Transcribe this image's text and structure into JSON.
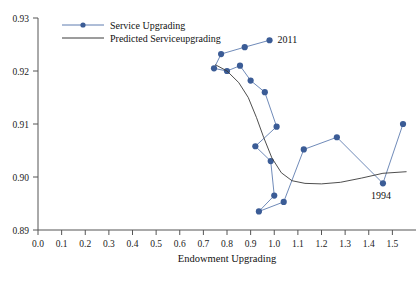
{
  "chart_data": {
    "type": "line",
    "title": "",
    "xlabel": "Endowment Upgrading",
    "ylabel": "",
    "xlim": [
      0.0,
      1.6
    ],
    "ylim": [
      0.89,
      0.93
    ],
    "grid": false,
    "legend_position": "top-left",
    "x_ticks": [
      "0.0",
      "0.1",
      "0.2",
      "0.3",
      "0.4",
      "0.5",
      "0.6",
      "0.7",
      "0.8",
      "0.9",
      "1.0",
      "1.1",
      "1.2",
      "1.3",
      "1.4",
      "1.5"
    ],
    "x_tick_values": [
      0.0,
      0.1,
      0.2,
      0.3,
      0.4,
      0.5,
      0.6,
      0.7,
      0.8,
      0.9,
      1.0,
      1.1,
      1.2,
      1.3,
      1.4,
      1.5
    ],
    "y_ticks": [
      "0.89",
      "0.90",
      "0.91",
      "0.92",
      "0.93"
    ],
    "y_tick_values": [
      0.89,
      0.9,
      0.91,
      0.92,
      0.93
    ],
    "series": [
      {
        "name": "Service Upgrading",
        "marker": "circle",
        "color": "#3b5c96",
        "line_color": "#5f7db0",
        "points": [
          {
            "x": 1.545,
            "y": 0.91
          },
          {
            "x": 1.46,
            "y": 0.8988
          },
          {
            "x": 1.265,
            "y": 0.9075
          },
          {
            "x": 1.125,
            "y": 0.9052
          },
          {
            "x": 1.04,
            "y": 0.8953
          },
          {
            "x": 0.935,
            "y": 0.8935
          },
          {
            "x": 1.0,
            "y": 0.8965
          },
          {
            "x": 0.985,
            "y": 0.903
          },
          {
            "x": 0.92,
            "y": 0.9058
          },
          {
            "x": 1.01,
            "y": 0.9095
          },
          {
            "x": 0.96,
            "y": 0.916
          },
          {
            "x": 0.9,
            "y": 0.9182
          },
          {
            "x": 0.855,
            "y": 0.921
          },
          {
            "x": 0.8,
            "y": 0.92
          },
          {
            "x": 0.745,
            "y": 0.9205
          },
          {
            "x": 0.775,
            "y": 0.9232
          },
          {
            "x": 0.875,
            "y": 0.9245
          },
          {
            "x": 0.98,
            "y": 0.9258
          }
        ]
      },
      {
        "name": "Predicted Serviceupgrading",
        "marker": "none",
        "color": "#3a3a3a",
        "line_color": "#3a3a3a",
        "points": [
          {
            "x": 0.75,
            "y": 0.9212
          },
          {
            "x": 0.8,
            "y": 0.92
          },
          {
            "x": 0.85,
            "y": 0.9178
          },
          {
            "x": 0.89,
            "y": 0.915
          },
          {
            "x": 0.925,
            "y": 0.9112
          },
          {
            "x": 0.955,
            "y": 0.9075
          },
          {
            "x": 0.99,
            "y": 0.9036
          },
          {
            "x": 1.03,
            "y": 0.9008
          },
          {
            "x": 1.075,
            "y": 0.8993
          },
          {
            "x": 1.13,
            "y": 0.8988
          },
          {
            "x": 1.2,
            "y": 0.8987
          },
          {
            "x": 1.28,
            "y": 0.899
          },
          {
            "x": 1.37,
            "y": 0.8998
          },
          {
            "x": 1.46,
            "y": 0.9007
          },
          {
            "x": 1.56,
            "y": 0.901
          }
        ]
      }
    ],
    "annotations": [
      {
        "label": "2011",
        "x": 0.98,
        "y": 0.9258
      },
      {
        "label": "1994",
        "x": 1.46,
        "y": 0.8988
      }
    ]
  },
  "legend": {
    "items": [
      {
        "label": "Service Upgrading",
        "style": "line-marker"
      },
      {
        "label": "Predicted Serviceupgrading",
        "style": "line"
      }
    ]
  },
  "axes": {
    "x_title": "Endowment Upgrading"
  },
  "colors": {
    "marker": "#3b5c96",
    "series_line": "#5f7db0",
    "predicted_line": "#3a3a3a",
    "axis": "#555555",
    "text": "#111111"
  }
}
